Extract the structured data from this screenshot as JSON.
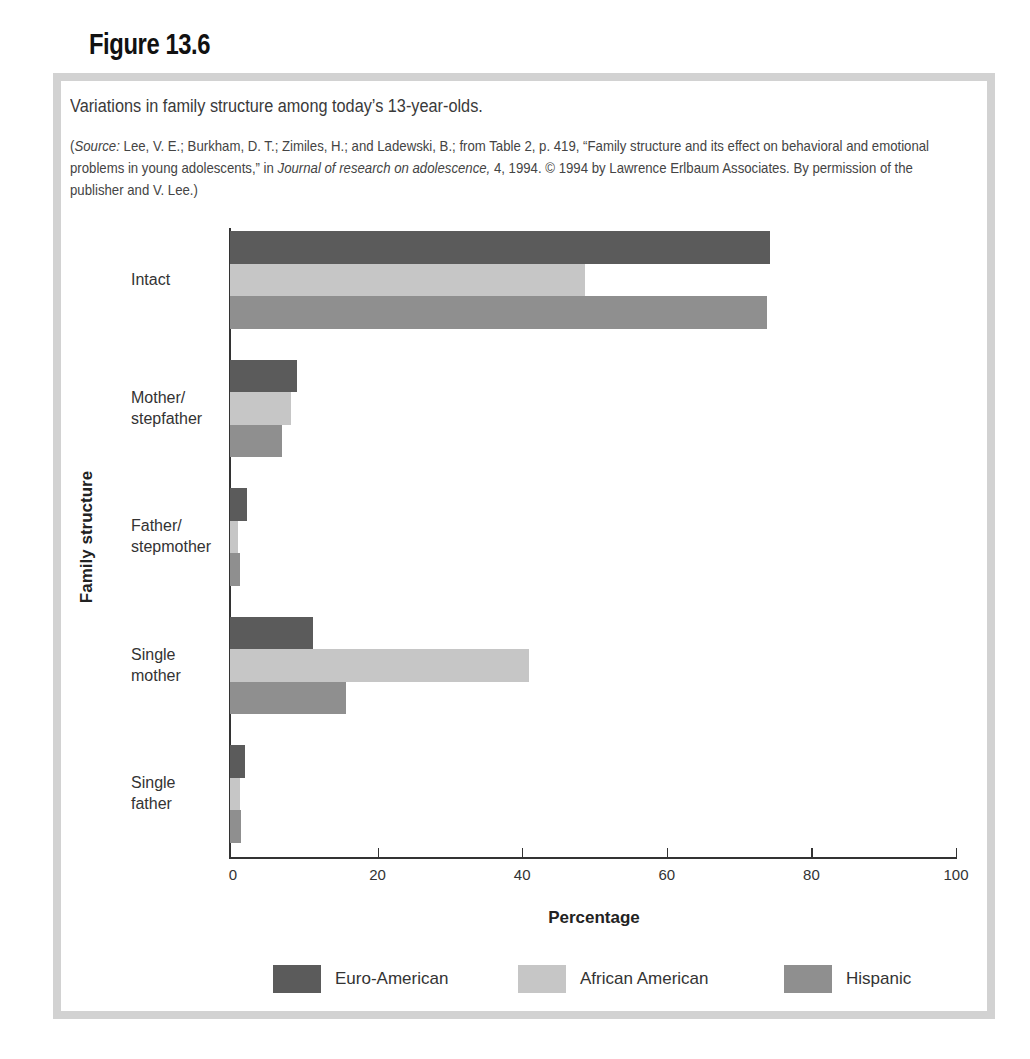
{
  "figure": {
    "label": "Figure 13.6",
    "caption": "Variations in family structure among today’s 13-year-olds.",
    "source_prefix": "(",
    "source_italic_label": "Source:",
    "source_text_1": " Lee, V. E.; Burkham, D. T.; Zimiles, H.; and Ladewski, B.; from Table 2, p. 419, “Family structure and its effect on behavioral and emotional problems in young adolescents,” in ",
    "source_journal": "Journal of research on adolescence,",
    "source_text_2": " 4, 1994. © 1994 by Lawrence Erlbaum Associates. By permission of the publisher and V. Lee.)"
  },
  "colors": {
    "euro_american": "#5b5b5b",
    "african_american": "#c6c6c6",
    "hispanic": "#8f8f8f",
    "frame": "#d2d2d2"
  },
  "chart_data": {
    "type": "bar",
    "orientation": "horizontal",
    "title": "Variations in family structure among today’s 13-year-olds.",
    "xlabel": "Percentage",
    "ylabel": "Family structure",
    "xlim": [
      0,
      100
    ],
    "xticks": [
      0,
      20,
      40,
      60,
      80,
      100
    ],
    "grid": false,
    "legend_position": "bottom",
    "categories": [
      "Intact",
      "Mother/ stepfather",
      "Father/ stepmother",
      "Single mother",
      "Single father"
    ],
    "category_lines": [
      [
        "Intact"
      ],
      [
        "Mother/",
        "stepfather"
      ],
      [
        "Father/",
        "stepmother"
      ],
      [
        "Single",
        "mother"
      ],
      [
        "Single",
        "father"
      ]
    ],
    "series": [
      {
        "name": "Euro-American",
        "values": [
          74.5,
          9.3,
          2.3,
          11.5,
          2.0
        ]
      },
      {
        "name": "African American",
        "values": [
          49.0,
          8.4,
          1.1,
          41.2,
          1.4
        ]
      },
      {
        "name": "Hispanic",
        "values": [
          74.0,
          7.2,
          1.4,
          16.0,
          1.5
        ]
      }
    ]
  }
}
